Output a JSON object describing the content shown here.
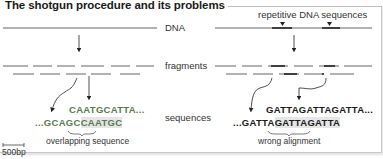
{
  "title": "The shotgun procedure and its problems",
  "labels": {
    "dna": "DNA",
    "fragments": "fragments",
    "sequences": "sequences",
    "repetitive": "repetitive DNA sequences",
    "overlapping": "overlapping sequence",
    "wrong_alignment": "wrong alignment",
    "scale": "500bp"
  },
  "left_panel": {
    "seq_top": "CAATGCATTA...",
    "seq_bottom_prefix": "...GCAGC",
    "seq_bottom_overlap": "CAATGC"
  },
  "right_panel": {
    "seq_top": "GATTAGATTAGATTA...",
    "seq_bottom_prefix": "...GATTA",
    "seq_bottom_overlap": "GATTAGATTA"
  },
  "colors": {
    "line": "#555555",
    "accent_seq": "#5a7a52",
    "highlight": "#e6e6e6"
  }
}
